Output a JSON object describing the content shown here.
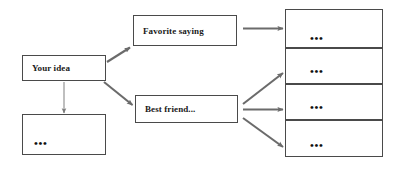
{
  "diagram": {
    "canvas": {
      "width": 408,
      "height": 174
    },
    "colors": {
      "background": "#ffffff",
      "box_border": "#4a4a4a",
      "arrow": "#6b6b6b",
      "text": "#1a1a1a"
    },
    "nodes": {
      "your_idea": {
        "label": "Your idea"
      },
      "favorite_saying": {
        "label": "Favorite saying"
      },
      "best_friend": {
        "label": "Best friend..."
      },
      "left_more": {
        "label": "•••"
      }
    },
    "stack": {
      "cells": [
        {
          "label": "•••"
        },
        {
          "label": "•••"
        },
        {
          "label": "•••"
        },
        {
          "label": "•••"
        }
      ]
    },
    "connectors": [
      {
        "name": "your-idea-to-favorite-saying",
        "style": "thick-diagonal-up"
      },
      {
        "name": "your-idea-to-best-friend",
        "style": "thick-diagonal-down"
      },
      {
        "name": "your-idea-to-left-more",
        "style": "thin-vertical-down"
      },
      {
        "name": "favorite-saying-to-stack-cell-1",
        "style": "thick-horizontal"
      },
      {
        "name": "best-friend-to-stack-cell-2",
        "style": "thick-diagonal-up"
      },
      {
        "name": "best-friend-to-stack-cell-3",
        "style": "thick-horizontal"
      },
      {
        "name": "best-friend-to-stack-cell-4",
        "style": "thick-diagonal-down"
      }
    ]
  }
}
